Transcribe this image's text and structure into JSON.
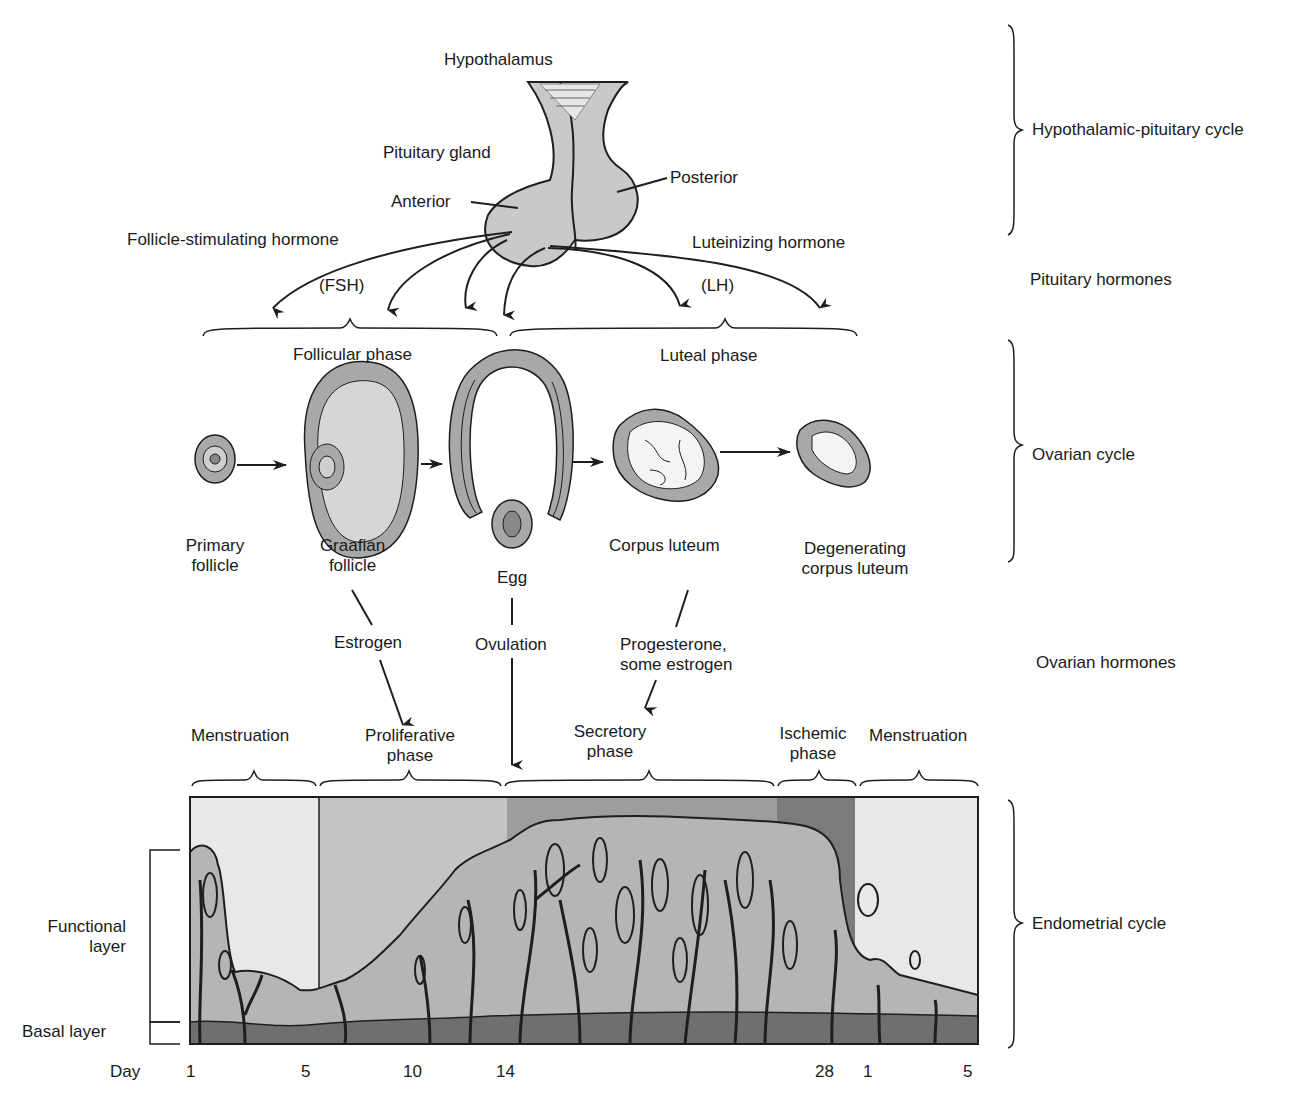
{
  "hypothalamic_pituitary": {
    "hypothalamus": "Hypothalamus",
    "pituitary_gland": "Pituitary gland",
    "anterior": "Anterior",
    "posterior": "Posterior",
    "fsh_name": "Follicle-stimulating hormone",
    "fsh_abbr": "(FSH)",
    "lh_name": "Luteinizing hormone",
    "lh_abbr": "(LH)"
  },
  "ovarian_phases": {
    "follicular": "Follicular phase",
    "luteal": "Luteal phase"
  },
  "ovarian_stages": [
    {
      "line1": "Primary",
      "line2": "follicle"
    },
    {
      "line1": "Graafian",
      "line2": "follicle"
    },
    {
      "line1": "Egg",
      "line2": ""
    },
    {
      "line1": "Corpus luteum",
      "line2": ""
    },
    {
      "line1": "Degenerating",
      "line2": "corpus luteum"
    }
  ],
  "ovarian_hormones": {
    "estrogen": "Estrogen",
    "ovulation": "Ovulation",
    "progesterone_line1": "Progesterone,",
    "progesterone_line2": "some estrogen"
  },
  "endometrial_phases": [
    {
      "line1": "Menstruation",
      "line2": ""
    },
    {
      "line1": "Proliferative",
      "line2": "phase"
    },
    {
      "line1": "Secretory",
      "line2": "phase"
    },
    {
      "line1": "Ischemic",
      "line2": "phase"
    },
    {
      "line1": "Menstruation",
      "line2": ""
    }
  ],
  "layers": {
    "functional_line1": "Functional",
    "functional_line2": "layer",
    "basal": "Basal layer"
  },
  "day_axis": {
    "label": "Day",
    "ticks": [
      "1",
      "5",
      "10",
      "14",
      "28",
      "1",
      "5"
    ]
  },
  "side_labels": {
    "hypothalamic_pituitary_cycle": "Hypothalamic-pituitary cycle",
    "pituitary_hormones": "Pituitary hormones",
    "ovarian_cycle": "Ovarian cycle",
    "ovarian_hormones": "Ovarian hormones",
    "endometrial_cycle": "Endometrial cycle"
  },
  "colors": {
    "line": "#1e1e1e",
    "gland_fill": "#c9c9c9",
    "follicle_outer": "#a8a8a8",
    "follicle_inner": "#d6d6d6",
    "menstruation_bg": "#e8e8e8",
    "proliferative_bg": "#c4c4c4",
    "secretory_bg": "#9d9d9d",
    "ischemic_bg": "#7b7b7b",
    "tissue": "#b5b5b5",
    "basal": "#6f6f6f"
  }
}
